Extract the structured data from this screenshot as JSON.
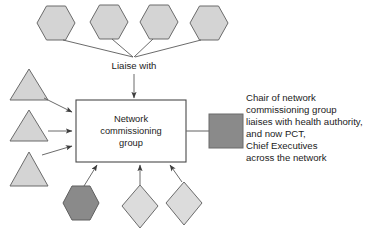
{
  "diagram": {
    "colors": {
      "shape_fill_light": "#d4d4d4",
      "shape_fill_pale": "#dcdcdc",
      "shape_fill_dark": "#8a8a8a",
      "shape_stroke": "#6b6b6b",
      "connector": "#5a5a5a",
      "text": "#1b1b1b",
      "box_fill": "#ffffff",
      "box_stroke": "#4a4a4a"
    },
    "central_node": {
      "name": "network-commissioning-group",
      "lines": [
        "Network",
        "commissioning",
        "group"
      ],
      "shape": "rectangle"
    },
    "edge_labels": [
      {
        "name": "liaise-with-label",
        "text": "Liaise with"
      }
    ],
    "top_nodes": [
      {
        "name": "top-hexagon-1",
        "shape": "hexagon",
        "fill": "#d4d4d4",
        "label": ""
      },
      {
        "name": "top-hexagon-2",
        "shape": "hexagon",
        "fill": "#d4d4d4",
        "label": ""
      },
      {
        "name": "top-hexagon-3",
        "shape": "hexagon",
        "fill": "#d4d4d4",
        "label": ""
      },
      {
        "name": "top-hexagon-4",
        "shape": "hexagon",
        "fill": "#d4d4d4",
        "label": ""
      }
    ],
    "left_nodes": [
      {
        "name": "left-triangle-1",
        "shape": "triangle",
        "fill": "#d4d4d4",
        "label": ""
      },
      {
        "name": "left-triangle-2",
        "shape": "triangle",
        "fill": "#d4d4d4",
        "label": ""
      },
      {
        "name": "left-triangle-3",
        "shape": "triangle",
        "fill": "#d4d4d4",
        "label": ""
      }
    ],
    "bottom_nodes": [
      {
        "name": "bottom-hexagon-dark",
        "shape": "hexagon",
        "fill": "#8a8a8a",
        "label": ""
      },
      {
        "name": "bottom-diamond-1",
        "shape": "diamond",
        "fill": "#dcdcdc",
        "label": ""
      },
      {
        "name": "bottom-diamond-2",
        "shape": "diamond",
        "fill": "#dcdcdc",
        "label": ""
      }
    ],
    "right_node": {
      "name": "right-square-dark",
      "shape": "square",
      "fill": "#8a8a8a",
      "label": ""
    },
    "annotation": {
      "name": "chair-annotation",
      "lines": [
        "Chair of network",
        "commissioning group",
        "liaises with health authority,",
        "and now PCT,",
        "Chief Executives",
        "across the network"
      ]
    }
  }
}
